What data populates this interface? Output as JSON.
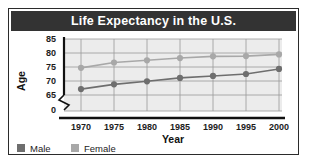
{
  "figure": {
    "title": "Life Expectancy in the U.S.",
    "title_background": "#333333",
    "title_color": "#ffffff",
    "border_color": "#2b2b2b",
    "plot_background": "#ececec"
  },
  "axes": {
    "y_title": "Age",
    "x_title": "Year",
    "y_ticks": [
      "85",
      "80",
      "75",
      "70",
      "65",
      "0"
    ],
    "x_ticks": [
      "1970",
      "1975",
      "1980",
      "1985",
      "1990",
      "1995",
      "2000"
    ],
    "axis_break": true
  },
  "legend": {
    "entries": [
      {
        "label": "Male",
        "color": "#6e6e6e"
      },
      {
        "label": "Female",
        "color": "#a8a8a8"
      }
    ]
  },
  "chart_data": {
    "type": "line",
    "title": "Life Expectancy in the U.S.",
    "xlabel": "Year",
    "ylabel": "Age",
    "x": [
      1970,
      1975,
      1980,
      1985,
      1990,
      1995,
      2000
    ],
    "categories": [
      "1970",
      "1975",
      "1980",
      "1985",
      "1990",
      "1995",
      "2000"
    ],
    "ylim": [
      65,
      85
    ],
    "yticks": [
      65,
      70,
      75,
      80,
      85
    ],
    "y_axis_break_at_zero": true,
    "grid": true,
    "legend_position": "below-left",
    "series": [
      {
        "name": "Male",
        "color": "#6e6e6e",
        "values": [
          67.1,
          68.8,
          69.9,
          71.1,
          71.8,
          72.5,
          74.3
        ]
      },
      {
        "name": "Female",
        "color": "#a8a8a8",
        "values": [
          74.7,
          76.6,
          77.4,
          78.2,
          78.8,
          78.9,
          79.5
        ]
      }
    ]
  }
}
